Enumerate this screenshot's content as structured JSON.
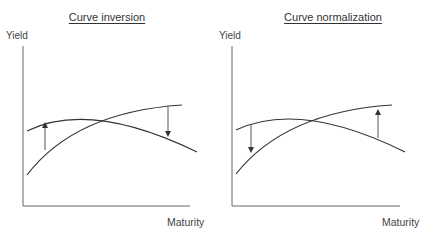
{
  "panels": [
    {
      "title": "Curve inversion",
      "y_axis_label": "Yield",
      "x_axis_label": "Maturity",
      "arrows": [
        {
          "position": "short-end",
          "direction": "up"
        },
        {
          "position": "long-end",
          "direction": "down"
        }
      ]
    },
    {
      "title": "Curve normalization",
      "y_axis_label": "Yield",
      "x_axis_label": "Maturity",
      "arrows": [
        {
          "position": "short-end",
          "direction": "down"
        },
        {
          "position": "long-end",
          "direction": "up"
        }
      ]
    }
  ],
  "colors": {
    "line": "#333333",
    "axis": "#555555",
    "arrow": "#444444"
  }
}
